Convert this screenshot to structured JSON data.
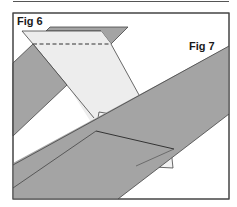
{
  "labels": {
    "fig6": "Fig 6",
    "fig7": "Fig 7"
  },
  "colors": {
    "background": "#ffffff",
    "dark_band": "#a4a4a4",
    "light_sheet": "#eeeeee",
    "stroke": "#333333"
  },
  "figures": [
    {
      "id": "fig6",
      "description": "folded sheet with dashed fold line and dark band"
    },
    {
      "id": "fig7",
      "description": "diagonal dark band with overlapping crossed band and small light flaps"
    }
  ]
}
